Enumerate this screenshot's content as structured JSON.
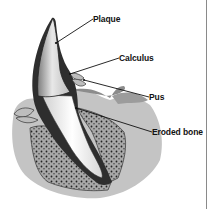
{
  "diagram": {
    "labels": [
      {
        "id": "plaque",
        "text": "Plaque",
        "x": 93,
        "y": 14
      },
      {
        "id": "calculus",
        "text": "Calculus",
        "x": 119,
        "y": 53
      },
      {
        "id": "pus",
        "text": "Pus",
        "x": 149,
        "y": 92
      },
      {
        "id": "eroded-bone",
        "text": "Eroded bone",
        "x": 152,
        "y": 127
      }
    ],
    "colors": {
      "ink": "#111111",
      "enamel": "#d9d9d9",
      "root": "#f2f2f2",
      "calculus": "#2b2b2b",
      "bone": "#9a9a9a",
      "gum": "#7a7a7a",
      "border": "#8a8a8a"
    }
  }
}
